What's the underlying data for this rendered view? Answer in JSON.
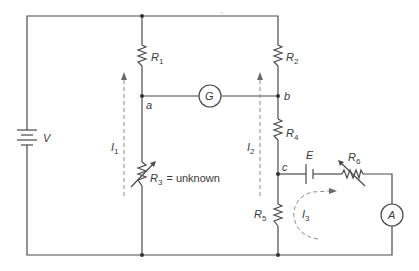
{
  "diagram": {
    "type": "circuit-schematic",
    "title": "",
    "colors": {
      "wire": "#4a4a4a",
      "label": "#3a3a3a",
      "current_arrow": "#8a8a8a",
      "background": "#ffffff"
    },
    "source": {
      "label": "V"
    },
    "resistors": [
      {
        "id": "R1",
        "base": "R",
        "sub": "1"
      },
      {
        "id": "R2",
        "base": "R",
        "sub": "2"
      },
      {
        "id": "R3",
        "base": "R",
        "sub": "3",
        "note": "= unknown",
        "variable": true
      },
      {
        "id": "R4",
        "base": "R",
        "sub": "4"
      },
      {
        "id": "R5",
        "base": "R",
        "sub": "5"
      },
      {
        "id": "R6",
        "base": "R",
        "sub": "6",
        "variable": true
      }
    ],
    "meters": {
      "galvanometer": "G",
      "ammeter": "A"
    },
    "emf": {
      "label": "E"
    },
    "nodes": {
      "a": "a",
      "b": "b",
      "c": "c"
    },
    "currents": [
      {
        "id": "I1",
        "base": "I",
        "sub": "1"
      },
      {
        "id": "I2",
        "base": "I",
        "sub": "2"
      },
      {
        "id": "I3",
        "base": "I",
        "sub": "3"
      }
    ]
  }
}
